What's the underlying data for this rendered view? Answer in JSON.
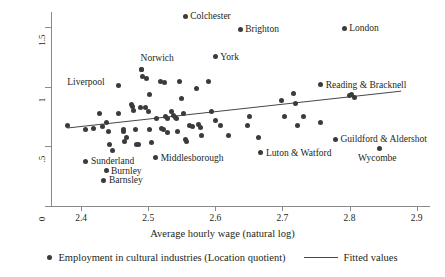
{
  "chart_data": {
    "type": "scatter",
    "title": "",
    "xlabel": "Average hourly wage (natural log)",
    "ylabel": "",
    "xlim": [
      2.355,
      2.92
    ],
    "ylim": [
      0,
      1.63
    ],
    "xticks": [
      "2.4",
      "2.5",
      "2.6",
      "2.7",
      "2.8",
      "2.9"
    ],
    "xtick_values": [
      2.4,
      2.5,
      2.6,
      2.7,
      2.8,
      2.9
    ],
    "yticks": [
      "0",
      ".5",
      "1",
      "1.5"
    ],
    "ytick_values": [
      0,
      0.5,
      1,
      1.5
    ],
    "grid": false,
    "legend_position": "bottom",
    "legend": [
      {
        "label": "Employment in cultural industries (Location quotient)",
        "marker": "dot"
      },
      {
        "label": "Fitted values",
        "marker": "line"
      }
    ],
    "fitted_line": {
      "x": [
        2.379,
        2.877
      ],
      "y": [
        0.655,
        0.965
      ]
    },
    "labeled_points": [
      {
        "label": "Colchester",
        "x": 2.555,
        "y": 1.595,
        "label_side": "right"
      },
      {
        "label": "Brighton",
        "x": 2.637,
        "y": 1.485,
        "label_side": "right"
      },
      {
        "label": "London",
        "x": 2.792,
        "y": 1.492,
        "label_side": "right"
      },
      {
        "label": "York",
        "x": 2.6,
        "y": 1.255,
        "label_side": "right"
      },
      {
        "label": "Norwich",
        "x": 2.49,
        "y": 1.145,
        "label_side": "above"
      },
      {
        "label": "Liverpool",
        "x": 2.43,
        "y": 1.04,
        "label_side": "text-only"
      },
      {
        "label": "Reading & Bracknell",
        "x": 2.757,
        "y": 1.02,
        "label_side": "right"
      },
      {
        "label": "Guildford & Aldershot",
        "x": 2.779,
        "y": 0.56,
        "label_side": "right"
      },
      {
        "label": "Wycombe",
        "x": 2.844,
        "y": 0.485,
        "label_side": "below"
      },
      {
        "label": "Luton & Watford",
        "x": 2.668,
        "y": 0.447,
        "label_side": "right"
      },
      {
        "label": "Middlesborough",
        "x": 2.511,
        "y": 0.405,
        "label_side": "right"
      },
      {
        "label": "Sunderland",
        "x": 2.407,
        "y": 0.375,
        "label_side": "right"
      },
      {
        "label": "Burnley",
        "x": 2.437,
        "y": 0.295,
        "label_side": "right"
      },
      {
        "label": "Barnsley",
        "x": 2.434,
        "y": 0.215,
        "label_side": "right"
      }
    ],
    "points": [
      {
        "x": 2.379,
        "y": 0.675
      },
      {
        "x": 2.407,
        "y": 0.64
      },
      {
        "x": 2.418,
        "y": 0.655
      },
      {
        "x": 2.432,
        "y": 0.665
      },
      {
        "x": 2.438,
        "y": 0.7
      },
      {
        "x": 2.44,
        "y": 0.63
      },
      {
        "x": 2.428,
        "y": 0.78
      },
      {
        "x": 2.442,
        "y": 0.52
      },
      {
        "x": 2.446,
        "y": 0.47
      },
      {
        "x": 2.456,
        "y": 1.01
      },
      {
        "x": 2.456,
        "y": 0.78
      },
      {
        "x": 2.463,
        "y": 0.625
      },
      {
        "x": 2.464,
        "y": 0.545
      },
      {
        "x": 2.463,
        "y": 0.645
      },
      {
        "x": 2.467,
        "y": 0.575
      },
      {
        "x": 2.475,
        "y": 0.855
      },
      {
        "x": 2.477,
        "y": 0.84
      },
      {
        "x": 2.478,
        "y": 0.805
      },
      {
        "x": 2.481,
        "y": 0.64
      },
      {
        "x": 2.483,
        "y": 0.52
      },
      {
        "x": 2.486,
        "y": 0.515
      },
      {
        "x": 2.488,
        "y": 0.825
      },
      {
        "x": 2.49,
        "y": 1.145
      },
      {
        "x": 2.492,
        "y": 1.09
      },
      {
        "x": 2.496,
        "y": 0.83
      },
      {
        "x": 2.498,
        "y": 1.075
      },
      {
        "x": 2.502,
        "y": 0.94
      },
      {
        "x": 2.5,
        "y": 0.79
      },
      {
        "x": 2.502,
        "y": 0.645
      },
      {
        "x": 2.505,
        "y": 0.53
      },
      {
        "x": 2.513,
        "y": 0.735
      },
      {
        "x": 2.518,
        "y": 1.045
      },
      {
        "x": 2.524,
        "y": 1.04
      },
      {
        "x": 2.52,
        "y": 0.655
      },
      {
        "x": 2.523,
        "y": 0.645
      },
      {
        "x": 2.526,
        "y": 0.755
      },
      {
        "x": 2.528,
        "y": 0.735
      },
      {
        "x": 2.529,
        "y": 0.62
      },
      {
        "x": 2.535,
        "y": 0.79
      },
      {
        "x": 2.538,
        "y": 0.76
      },
      {
        "x": 2.54,
        "y": 0.745
      },
      {
        "x": 2.542,
        "y": 0.735
      },
      {
        "x": 2.544,
        "y": 0.625
      },
      {
        "x": 2.547,
        "y": 1.045
      },
      {
        "x": 2.55,
        "y": 0.9
      },
      {
        "x": 2.553,
        "y": 0.775
      },
      {
        "x": 2.555,
        "y": 0.555
      },
      {
        "x": 2.557,
        "y": 0.545
      },
      {
        "x": 2.561,
        "y": 0.675
      },
      {
        "x": 2.566,
        "y": 0.67
      },
      {
        "x": 2.572,
        "y": 0.99
      },
      {
        "x": 2.575,
        "y": 0.685
      },
      {
        "x": 2.578,
        "y": 0.66
      },
      {
        "x": 2.58,
        "y": 0.595
      },
      {
        "x": 2.59,
        "y": 1.045
      },
      {
        "x": 2.594,
        "y": 0.795
      },
      {
        "x": 2.6,
        "y": 0.715
      },
      {
        "x": 2.607,
        "y": 0.675
      },
      {
        "x": 2.62,
        "y": 0.59
      },
      {
        "x": 2.648,
        "y": 0.68
      },
      {
        "x": 2.651,
        "y": 0.755
      },
      {
        "x": 2.664,
        "y": 0.575
      },
      {
        "x": 2.698,
        "y": 0.89
      },
      {
        "x": 2.703,
        "y": 0.755
      },
      {
        "x": 2.716,
        "y": 0.945
      },
      {
        "x": 2.72,
        "y": 0.865
      },
      {
        "x": 2.722,
        "y": 0.675
      },
      {
        "x": 2.731,
        "y": 0.755
      },
      {
        "x": 2.757,
        "y": 0.7
      },
      {
        "x": 2.8,
        "y": 0.925
      },
      {
        "x": 2.803,
        "y": 0.94
      },
      {
        "x": 2.807,
        "y": 0.915
      }
    ]
  }
}
